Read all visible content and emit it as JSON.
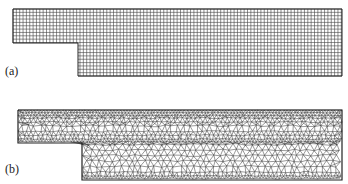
{
  "figure": {
    "panels": [
      {
        "id": "a",
        "label": "(a)",
        "mesh_type": "structured quadrilateral grid",
        "color": "#333333"
      },
      {
        "id": "b",
        "label": "(b)",
        "mesh_type": "unstructured triangular mesh",
        "color": "#333333"
      }
    ],
    "geometry": "backward-facing step channel"
  }
}
